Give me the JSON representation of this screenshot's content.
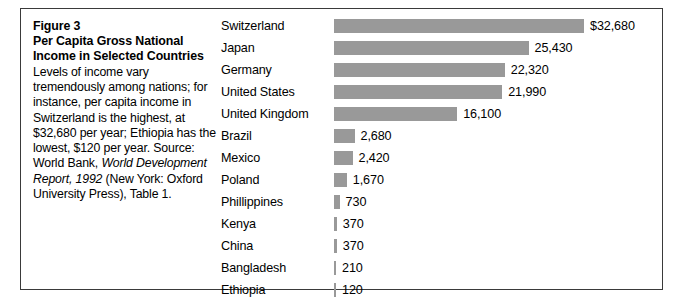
{
  "figure": {
    "number": "Figure 3",
    "title_line1": "Per Capita Gross National",
    "title_line2": "Income in Selected Countries",
    "caption_text_1": "Levels of income vary tremendously among nations; for instance, per capita income in Switzerland is the highest, at $32,680 per year; Ethiopia has the lowest, $120 per year. Source: World Bank, ",
    "caption_source_italic": "World Development Report, 1992",
    "caption_text_2": " (New York: Oxford University Press), Table 1."
  },
  "colors": {
    "bar": "#999999",
    "frame": "#3a3a3a",
    "text": "#000000",
    "background": "#ffffff"
  },
  "chart_data": {
    "type": "bar",
    "orientation": "horizontal",
    "title": "Per Capita Gross National Income in Selected Countries",
    "xlabel": "",
    "ylabel": "",
    "xlim": [
      0,
      32680
    ],
    "grid": false,
    "legend": false,
    "value_unit": "US dollars per capita",
    "categories": [
      "Switzerland",
      "Japan",
      "Germany",
      "United States",
      "United Kingdom",
      "Brazil",
      "Mexico",
      "Poland",
      "Phillippines",
      "Kenya",
      "China",
      "Bangladesh",
      "Ethiopia"
    ],
    "values": [
      32680,
      25430,
      22320,
      21990,
      16100,
      2680,
      2420,
      1670,
      730,
      370,
      370,
      210,
      120
    ],
    "data_labels": [
      "$32,680",
      "25,430",
      "22,320",
      "21,990",
      "16,100",
      "2,680",
      "2,420",
      "1,670",
      "730",
      "370",
      "370",
      "210",
      "120"
    ]
  }
}
